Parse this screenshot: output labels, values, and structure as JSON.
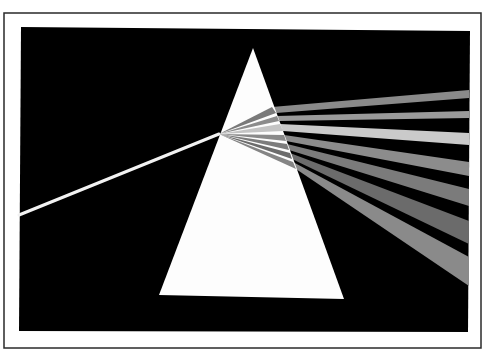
{
  "canvas": {
    "width": 485,
    "height": 357,
    "background": "#ffffff"
  },
  "frame": {
    "outer_border": {
      "x1": 4,
      "y1": 13,
      "x2": 481,
      "y2": 348,
      "stroke": "#2a2a2a",
      "stroke_width": 1.5
    },
    "panel": {
      "points": [
        [
          21,
          27
        ],
        [
          470,
          31
        ],
        [
          468,
          332
        ],
        [
          19,
          331
        ]
      ],
      "fill": "#000000"
    }
  },
  "prism": {
    "points": [
      [
        253,
        48
      ],
      [
        344,
        299
      ],
      [
        159,
        295
      ]
    ],
    "fill": "#fdfdfd"
  },
  "incident_beam": {
    "from": [
      19,
      215
    ],
    "to": [
      219,
      134
    ],
    "width": 3,
    "color": "#f2f2f2"
  },
  "internal_rays": {
    "origin": [
      219,
      134
    ],
    "rays": [
      {
        "exit_top": [
          272,
          107
        ],
        "exit_bottom": [
          276,
          113
        ],
        "color": "#7a7a7a"
      },
      {
        "exit_top": [
          277,
          116
        ],
        "exit_bottom": [
          279,
          121
        ],
        "color": "#8c8c8c"
      },
      {
        "exit_top": [
          280,
          124
        ],
        "exit_bottom": [
          283,
          131
        ],
        "color": "#c4c4c4"
      },
      {
        "exit_top": [
          284,
          135
        ],
        "exit_bottom": [
          286,
          141
        ],
        "color": "#8a8a8a"
      },
      {
        "exit_top": [
          287,
          144
        ],
        "exit_bottom": [
          289,
          150
        ],
        "color": "#7c7c7c"
      },
      {
        "exit_top": [
          290,
          153
        ],
        "exit_bottom": [
          292,
          159
        ],
        "color": "#6c6c6c"
      },
      {
        "exit_top": [
          293,
          162
        ],
        "exit_bottom": [
          296,
          169
        ],
        "color": "#858585"
      }
    ]
  },
  "spectrum_beams": [
    {
      "name": "beam-1",
      "exit_top": [
        272,
        107
      ],
      "exit_bottom": [
        276,
        113
      ],
      "end_top": [
        469,
        90
      ],
      "end_bottom": [
        469,
        98
      ],
      "color": "#8a8a8a"
    },
    {
      "name": "beam-2",
      "exit_top": [
        277,
        116
      ],
      "exit_bottom": [
        279,
        121
      ],
      "end_top": [
        469,
        111
      ],
      "end_bottom": [
        469,
        118
      ],
      "color": "#9a9a9a"
    },
    {
      "name": "beam-3",
      "exit_top": [
        280,
        124
      ],
      "exit_bottom": [
        283,
        131
      ],
      "end_top": [
        469,
        133
      ],
      "end_bottom": [
        469,
        145
      ],
      "color": "#cacaca"
    },
    {
      "name": "beam-4",
      "exit_top": [
        284,
        135
      ],
      "exit_bottom": [
        286,
        141
      ],
      "end_top": [
        469,
        162
      ],
      "end_bottom": [
        469,
        176
      ],
      "color": "#8c8c8c"
    },
    {
      "name": "beam-5",
      "exit_top": [
        287,
        144
      ],
      "exit_bottom": [
        289,
        150
      ],
      "end_top": [
        469,
        189
      ],
      "end_bottom": [
        469,
        206
      ],
      "color": "#7b7b7b"
    },
    {
      "name": "beam-6",
      "exit_top": [
        290,
        153
      ],
      "exit_bottom": [
        292,
        159
      ],
      "end_top": [
        469,
        221
      ],
      "end_bottom": [
        469,
        244
      ],
      "color": "#6b6b6b"
    },
    {
      "name": "beam-7",
      "exit_top": [
        293,
        162
      ],
      "exit_bottom": [
        296,
        169
      ],
      "end_top": [
        469,
        257
      ],
      "end_bottom": [
        469,
        286
      ],
      "color": "#8a8a8a"
    }
  ]
}
